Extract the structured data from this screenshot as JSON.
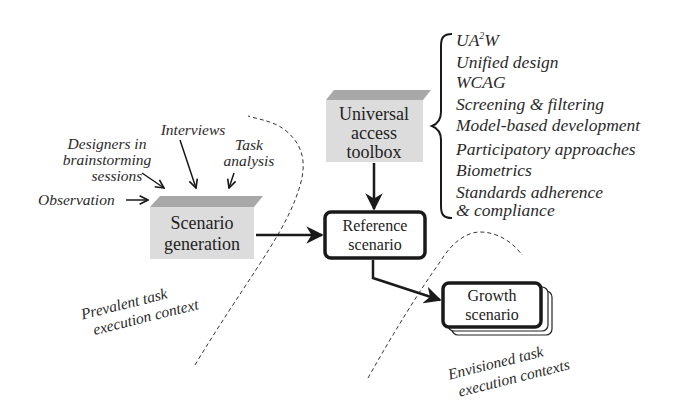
{
  "diagram": {
    "inputs": {
      "designers": [
        "Designers in",
        "brainstorming",
        "sessions"
      ],
      "interviews": "Interviews",
      "task_analysis": [
        "Task",
        "analysis"
      ],
      "observation": "Observation"
    },
    "boxes": {
      "scenario_generation": [
        "Scenario",
        "generation"
      ],
      "universal_access_toolbox": [
        "Universal",
        "access",
        "toolbox"
      ],
      "reference_scenario": [
        "Reference",
        "scenario"
      ],
      "growth_scenario": [
        "Growth",
        "scenario"
      ]
    },
    "toolbox_items": {
      "ua2w_base": "UA",
      "ua2w_sup": "2",
      "ua2w_end": "W",
      "items": [
        "Unified design",
        "WCAG",
        "Screening & filtering",
        "Model-based development",
        "Participatory approaches",
        "Biometrics",
        "Standards adherence",
        "& compliance"
      ]
    },
    "contexts": {
      "prevalent": [
        "Prevalent task",
        "execution context"
      ],
      "envisioned": [
        "Envisioned task",
        "execution contexts"
      ]
    },
    "colors": {
      "box_fill": "#dcdcdc",
      "box_top": "#a8a8a8",
      "stroke": "#1a1a1a",
      "text": "#2a2a2a"
    }
  }
}
